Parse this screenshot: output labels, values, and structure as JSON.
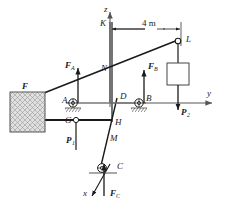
{
  "figure": {
    "type": "engineering-statics-free-body-diagram",
    "axes": {
      "z_label": "z",
      "y_label": "y",
      "x_label": "x"
    },
    "dimension": {
      "value": "4 m"
    },
    "points": {
      "K": "K",
      "L": "L",
      "N": "N",
      "A": "A",
      "B": "B",
      "C": "C",
      "D": "D",
      "G": "G",
      "H": "H",
      "M": "M"
    },
    "forces": {
      "F": "F",
      "FA": "F",
      "FA_sub": "A",
      "FB": "F",
      "FB_sub": "B",
      "FC": "F",
      "FC_sub": "C",
      "P1": "P",
      "P1_sub": "1",
      "P2": "P",
      "P2_sub": "2"
    },
    "colors": {
      "line": "#1a1a1a",
      "axis": "#555555",
      "hatch": "#8a8a8a",
      "block_fill": "#d8d8d8",
      "background": "#ffffff"
    }
  }
}
